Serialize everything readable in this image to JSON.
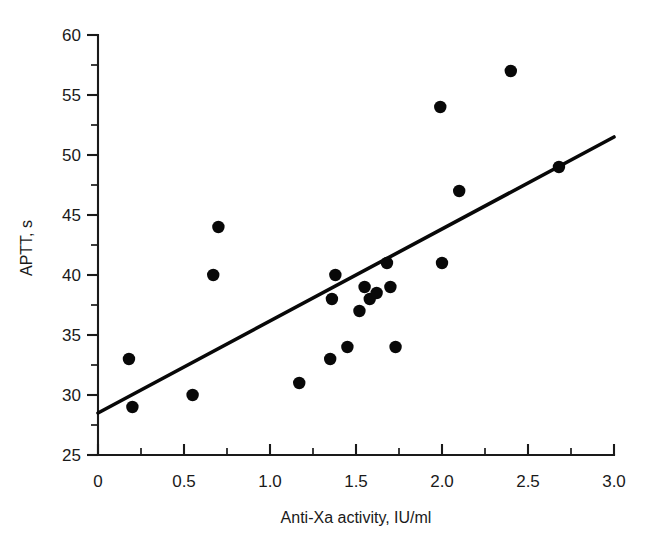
{
  "chart_data": {
    "type": "scatter",
    "title": "",
    "xlabel": "Anti-Xa activity, IU/ml",
    "ylabel": "APTT, s",
    "xlim": [
      0,
      3.0
    ],
    "ylim": [
      25,
      60
    ],
    "grid": false,
    "legend": null,
    "x_major_ticks": [
      0,
      0.5,
      1.0,
      1.5,
      2.0,
      2.5,
      3.0
    ],
    "x_tick_labels": [
      "0",
      "0.5",
      "1.0",
      "1.5",
      "2.0",
      "2.5",
      "3.0"
    ],
    "x_minor_step": 0.25,
    "y_major_ticks": [
      25,
      30,
      35,
      40,
      45,
      50,
      55,
      60
    ],
    "y_tick_labels": [
      "25",
      "30",
      "35",
      "40",
      "45",
      "50",
      "55",
      "60"
    ],
    "y_minor_step": 2.5,
    "marker": "filled-circle",
    "marker_color": "#080808",
    "points": [
      {
        "x": 0.18,
        "y": 33
      },
      {
        "x": 0.2,
        "y": 29
      },
      {
        "x": 0.55,
        "y": 30
      },
      {
        "x": 0.67,
        "y": 40
      },
      {
        "x": 0.7,
        "y": 44
      },
      {
        "x": 1.17,
        "y": 31
      },
      {
        "x": 1.35,
        "y": 33
      },
      {
        "x": 1.36,
        "y": 38
      },
      {
        "x": 1.38,
        "y": 40
      },
      {
        "x": 1.45,
        "y": 34
      },
      {
        "x": 1.52,
        "y": 37
      },
      {
        "x": 1.55,
        "y": 39
      },
      {
        "x": 1.58,
        "y": 38
      },
      {
        "x": 1.62,
        "y": 38.5
      },
      {
        "x": 1.68,
        "y": 41
      },
      {
        "x": 1.7,
        "y": 39
      },
      {
        "x": 1.73,
        "y": 34
      },
      {
        "x": 1.99,
        "y": 54
      },
      {
        "x": 2.0,
        "y": 41
      },
      {
        "x": 2.1,
        "y": 47
      },
      {
        "x": 2.4,
        "y": 57
      },
      {
        "x": 2.68,
        "y": 49
      }
    ],
    "fit_line": {
      "type": "linear-regression",
      "x_start": 0,
      "y_start": 28.5,
      "x_end": 3.0,
      "y_end": 51.5,
      "color": "#080808"
    }
  },
  "layout": {
    "plot_left_px": 98,
    "plot_right_px": 614,
    "plot_top_px": 35,
    "plot_bottom_px": 455,
    "marker_radius_px": 6.2
  }
}
